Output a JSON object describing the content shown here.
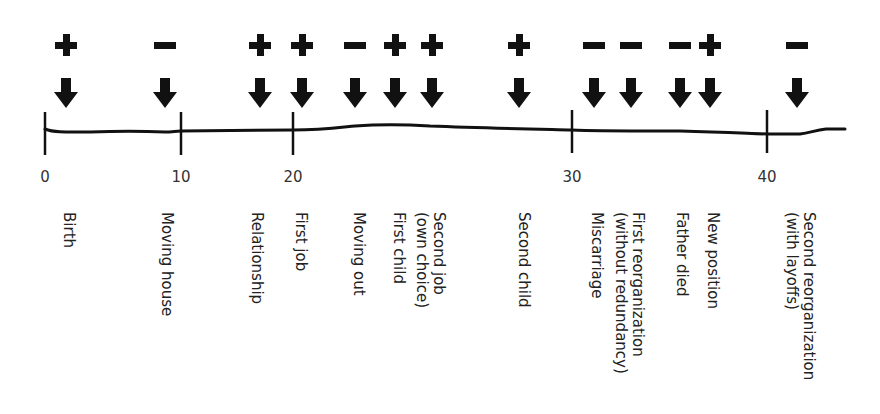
{
  "chart_data": {
    "type": "timeline",
    "title": "",
    "xlabel": "Age",
    "axis": {
      "range": [
        0,
        45
      ],
      "ticks": [
        0,
        10,
        20,
        30,
        40
      ]
    },
    "events": [
      {
        "label": "Birth",
        "age": 1.5,
        "sign": "+"
      },
      {
        "label": "Moving house",
        "age": 9,
        "sign": "-"
      },
      {
        "label": "Relationship",
        "age": 17,
        "sign": "+"
      },
      {
        "label": "First job",
        "age": 20.5,
        "sign": "+"
      },
      {
        "label": "Moving out",
        "age": 23,
        "sign": "-"
      },
      {
        "label": "First child",
        "age": 25,
        "sign": "+"
      },
      {
        "label": "Second job\n(own choice)",
        "age": 26.5,
        "sign": "+"
      },
      {
        "label": "Second child",
        "age": 29.5,
        "sign": "+"
      },
      {
        "label": "Miscarriage",
        "age": 31,
        "sign": "-"
      },
      {
        "label": "First reorganization\n(without redundancy)",
        "age": 33,
        "sign": "-"
      },
      {
        "label": "Father died",
        "age": 35.5,
        "sign": "-"
      },
      {
        "label": "New position",
        "age": 37,
        "sign": "+"
      },
      {
        "label": "Second reorganization\n(with layoffs)",
        "age": 41.5,
        "sign": "-"
      }
    ]
  },
  "ticks": [
    {
      "label": "0",
      "x": 45
    },
    {
      "label": "10",
      "x": 181
    },
    {
      "label": "20",
      "x": 293
    },
    {
      "label": "30",
      "x": 572
    },
    {
      "label": "40",
      "x": 767
    }
  ],
  "events": [
    {
      "label": "Birth",
      "sign": "+",
      "x": 66,
      "label_x": 60
    },
    {
      "label": "Moving house",
      "sign": "-",
      "x": 165,
      "label_x": 158
    },
    {
      "label": "Relationship",
      "sign": "+",
      "x": 260,
      "label_x": 248
    },
    {
      "label": "First job",
      "sign": "+",
      "x": 302,
      "label_x": 292
    },
    {
      "label": "Moving out",
      "sign": "-",
      "x": 355,
      "label_x": 350
    },
    {
      "label": "First child",
      "sign": "+",
      "x": 395,
      "label_x": 390
    },
    {
      "label": "Second job\n(own choice)",
      "sign": "+",
      "x": 432,
      "label_x": 413
    },
    {
      "label": "Second child",
      "sign": "+",
      "x": 519,
      "label_x": 515
    },
    {
      "label": "Miscarriage",
      "sign": "-",
      "x": 594,
      "label_x": 588
    },
    {
      "label": "First reorganization\n(without redundancy)",
      "sign": "-",
      "x": 631,
      "label_x": 612
    },
    {
      "label": "Father died",
      "sign": "-",
      "x": 680,
      "label_x": 673
    },
    {
      "label": "New position",
      "sign": "+",
      "x": 710,
      "label_x": 704
    },
    {
      "label": "Second reorganization\n(with layoffs)",
      "sign": "-",
      "x": 797,
      "label_x": 783
    }
  ],
  "colors": {
    "ink": "#111111",
    "text": "#222222",
    "background": "#ffffff"
  }
}
